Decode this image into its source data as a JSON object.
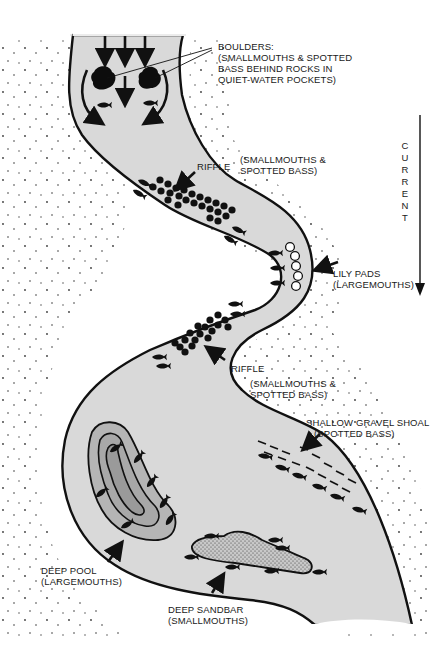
{
  "diagram": {
    "current": {
      "label_letters": [
        "C",
        "U",
        "R",
        "R",
        "E",
        "N",
        "T"
      ],
      "direction": "down"
    },
    "labels": {
      "boulders": {
        "line1": "BOULDERS:",
        "line2": "(SMALLMOUTHS & SPOTTED",
        "line3": "BASS BEHIND ROCKS IN",
        "line4": "QUIET-WATER POCKETS)"
      },
      "riffle_top": {
        "name": "RIFFLE",
        "line1": "(SMALLMOUTHS &",
        "line2": "SPOTTED BASS)"
      },
      "lily_pads": {
        "line1": "LILY PADS",
        "line2": "(LARGEMOUTHS)"
      },
      "riffle_middle": {
        "name": "RIFFLE",
        "line1": "(SMALLMOUTHS &",
        "line2": "SPOTTED BASS)"
      },
      "gravel_shoal": {
        "line1": "SHALLOW GRAVEL SHOAL",
        "line2": "(SPOTTED BASS)"
      },
      "deep_pool": {
        "line1": "DEEP POOL",
        "line2": "(LARGEMOUTHS)"
      },
      "deep_sandbar": {
        "line1": "DEEP SANDBAR",
        "line2": "(SMALLMOUTHS)"
      }
    },
    "colors": {
      "water": "#d9d9d9",
      "pool_outer": "#b5b5b5",
      "pool_inner": "#9a9a9a",
      "sandbar": "#c8c8c8",
      "ink": "#111111",
      "paper": "#ffffff"
    }
  }
}
